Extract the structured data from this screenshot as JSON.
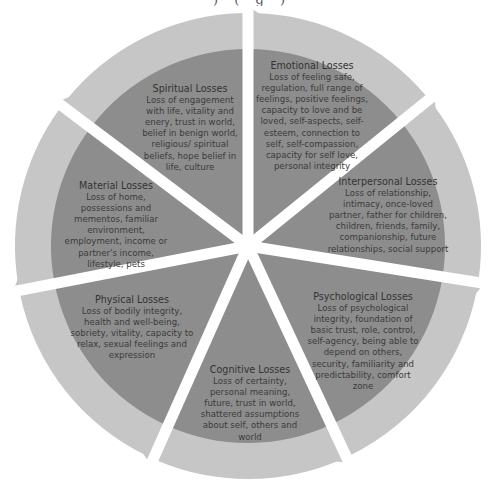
{
  "header_fragment": ") (  g  )",
  "colors": {
    "wedge_fill": "#8d8d8d",
    "arrow_ring": "#c6c6c6",
    "arrow_ring_shadow": "#b3b3b3",
    "gap": "#ffffff",
    "text": "#3b3b3b"
  },
  "center": {
    "x": 248,
    "y": 246
  },
  "segments": [
    {
      "id": "emotional",
      "title": "Emotional Losses",
      "body": "Loss of feeling safe, regulation, full range of feelings, positive feelings, capacity to love and be loved, self-aspects, self-esteem, connection to self, self-compassion, capacity for self love, personal integrity"
    },
    {
      "id": "interpersonal",
      "title": "Interpersonal Losses",
      "body": "Loss of relationship, intimacy, once-loved partner, father for children, children, friends, family, companionship, future relationships, social support"
    },
    {
      "id": "psychological",
      "title": "Psychological Losses",
      "body": "Loss of psychological integrity, foundation of basic trust, role, control, self-agency, being able to depend on others, security, familiarity and predictability, comfort zone"
    },
    {
      "id": "cognitive",
      "title": "Cognitive Losses",
      "body": "Loss of certainty, personal meaning, future, trust in world, shattered assumptions about self, others and world"
    },
    {
      "id": "physical",
      "title": "Physical Losses",
      "body": "Loss of bodily integrity, health and well-being, sobriety, vitality, capacity to relax, sexual feelings and expression"
    },
    {
      "id": "material",
      "title": "Material Losses",
      "body": "Loss of home, possessions and mementos, familiar environment, employment, income or partner's income, lifestyle, pets"
    },
    {
      "id": "spiritual",
      "title": "Spiritual Losses",
      "body": "Loss of engagement with life, vitality and enery, trust in world, belief in benign world, religious/ spiritual beliefs, hope belief in life, culture"
    }
  ]
}
